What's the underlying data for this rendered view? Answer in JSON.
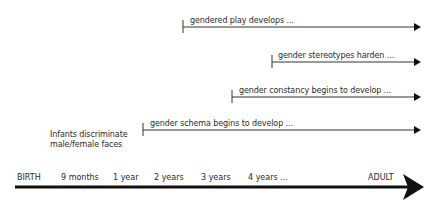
{
  "diagram": {
    "title": "",
    "timeline": {
      "labels": [
        "BIRTH",
        "9 months",
        "1 year",
        "2 years",
        "3 years",
        "4 years ...",
        "ADULT"
      ],
      "start_label": "BIRTH",
      "end_label": "ADULT"
    },
    "annotation": {
      "line1": "Infants discriminate",
      "line2": "male/female faces"
    },
    "developments": [
      {
        "label": "gendered play develops ...",
        "start_x": 183,
        "y": 27
      },
      {
        "label": "gender stereotypes harden ...",
        "start_x": 272,
        "y": 62
      },
      {
        "label": "gender constancy begins to develop ...",
        "start_x": 232,
        "y": 97
      },
      {
        "label": "gender schema begins to develop ...",
        "start_x": 143,
        "y": 130
      }
    ],
    "colors": {
      "line": "#333333",
      "text": "#2a2a2a",
      "axis": "#111111"
    }
  }
}
